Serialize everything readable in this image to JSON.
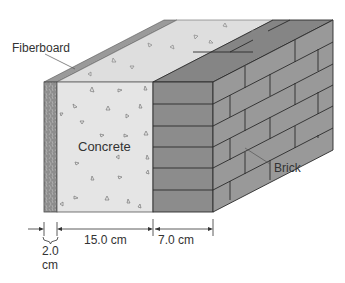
{
  "diagram": {
    "layers": [
      {
        "name": "Fiberboard",
        "thickness": "2.0 cm"
      },
      {
        "name": "Concrete",
        "thickness": "15.0 cm"
      },
      {
        "name": "Brick",
        "thickness": "7.0 cm"
      }
    ],
    "labels": {
      "fiberboard": "Fiberboard",
      "concrete": "Concrete",
      "brick": "Brick"
    },
    "dimensions": {
      "fiberboard_value": "2.0",
      "fiberboard_unit": "cm",
      "concrete": "15.0 cm",
      "brick": "7.0 cm"
    },
    "colors": {
      "fiberboard": "#8a8a8a",
      "concrete": "#e3e3e3",
      "concrete_top": "#dcdcdc",
      "brick_front": "#8c8c8c",
      "brick_side": "#9a9a9a",
      "brick_top": "#7f7f7f",
      "outline": "#2a2a2a"
    }
  }
}
